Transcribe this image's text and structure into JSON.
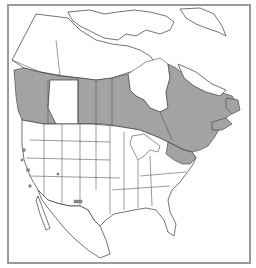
{
  "map": {
    "title": "Native range distribution map — North America",
    "region": "North America (Canada, United States, Mexico, Greenland)",
    "legend": {
      "shaded": "Native range",
      "shaded_color": "#a3a3a3",
      "outline_color": "#3a3a3a",
      "frame_color": "#9a9a9a",
      "background": "#ffffff"
    },
    "shaded_regions": [
      "Southern British Columbia (west coast & interior)",
      "Southern Alberta prairie band",
      "Saskatchewan",
      "Manitoba",
      "Ontario (excluding far north)",
      "Quebec",
      "Labrador / Newfoundland",
      "Maritime provinces (New Brunswick, Nova Scotia)",
      "New England and northern New York",
      "Isolated disjunct patches in western US (Washington, Oregon, California, Utah, Colorado, New Mexico)"
    ]
  }
}
